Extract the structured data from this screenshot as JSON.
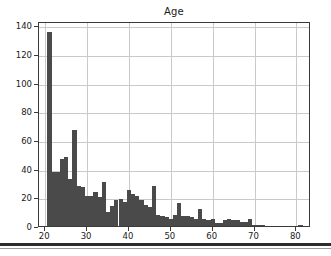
{
  "chart_data": {
    "type": "bar",
    "title": "Age",
    "xlabel": "",
    "ylabel": "",
    "xlim": [
      18.5,
      83.5
    ],
    "ylim": [
      0,
      143
    ],
    "grid": true,
    "legend": null,
    "bin_width": 1,
    "xticks": [
      20,
      30,
      40,
      50,
      60,
      70,
      80
    ],
    "yticks": [
      0,
      20,
      40,
      60,
      80,
      100,
      120,
      140
    ],
    "x": [
      21,
      22,
      23,
      24,
      25,
      26,
      27,
      28,
      29,
      30,
      31,
      32,
      33,
      34,
      35,
      36,
      37,
      38,
      39,
      40,
      41,
      42,
      43,
      44,
      45,
      46,
      47,
      48,
      49,
      50,
      51,
      52,
      53,
      54,
      55,
      56,
      57,
      58,
      59,
      60,
      61,
      62,
      63,
      64,
      65,
      66,
      67,
      68,
      69,
      70,
      71,
      72,
      81
    ],
    "values": [
      135,
      38,
      38,
      47,
      48,
      33,
      67,
      28,
      27,
      21,
      21,
      24,
      20,
      31,
      10,
      14,
      18,
      19,
      17,
      25,
      22,
      21,
      18,
      15,
      13,
      28,
      8,
      7,
      6,
      5,
      8,
      16,
      7,
      7,
      6,
      5,
      12,
      5,
      4,
      5,
      2,
      2,
      4,
      5,
      4,
      4,
      3,
      3,
      5,
      1,
      1,
      1,
      1
    ],
    "bar_color": "#4a4a4a",
    "grid_color": "#c9c9c9",
    "frame_color": "#3a3a3a",
    "background_color": "#ffffff"
  },
  "figure": {
    "title_text": "Age"
  }
}
